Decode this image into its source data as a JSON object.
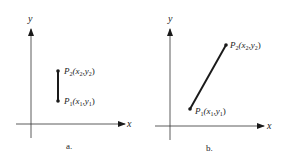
{
  "diagram": {
    "colors": {
      "ink": "#1a1a1a",
      "axis": "#333333",
      "background": "#ffffff"
    },
    "panels": [
      {
        "id": "a",
        "caption": "a.",
        "axis_labels": {
          "x": "x",
          "y": "y"
        },
        "segment": "vertical",
        "points": [
          {
            "name": "P",
            "sub": "2",
            "label": "P2(x2,y2)",
            "coord_open": "(x",
            "coord_sub1": "2",
            "coord_mid": ",y",
            "coord_sub2": "2",
            "coord_close": ")"
          },
          {
            "name": "P",
            "sub": "1",
            "label": "P1(x1,y1)",
            "coord_open": "(x",
            "coord_sub1": "1",
            "coord_mid": ",y",
            "coord_sub2": "1",
            "coord_close": ")"
          }
        ]
      },
      {
        "id": "b",
        "caption": "b.",
        "axis_labels": {
          "x": "x",
          "y": "y"
        },
        "segment": "oblique",
        "points": [
          {
            "name": "P",
            "sub": "2",
            "label": "P2(x2,y2)",
            "coord_open": "(x",
            "coord_sub1": "2",
            "coord_mid": ",y",
            "coord_sub2": "2",
            "coord_close": ")"
          },
          {
            "name": "P",
            "sub": "1",
            "label": "P1(x1,y1)",
            "coord_open": "(x",
            "coord_sub1": "1",
            "coord_mid": ",y",
            "coord_sub2": "1",
            "coord_close": ")"
          }
        ]
      }
    ]
  }
}
